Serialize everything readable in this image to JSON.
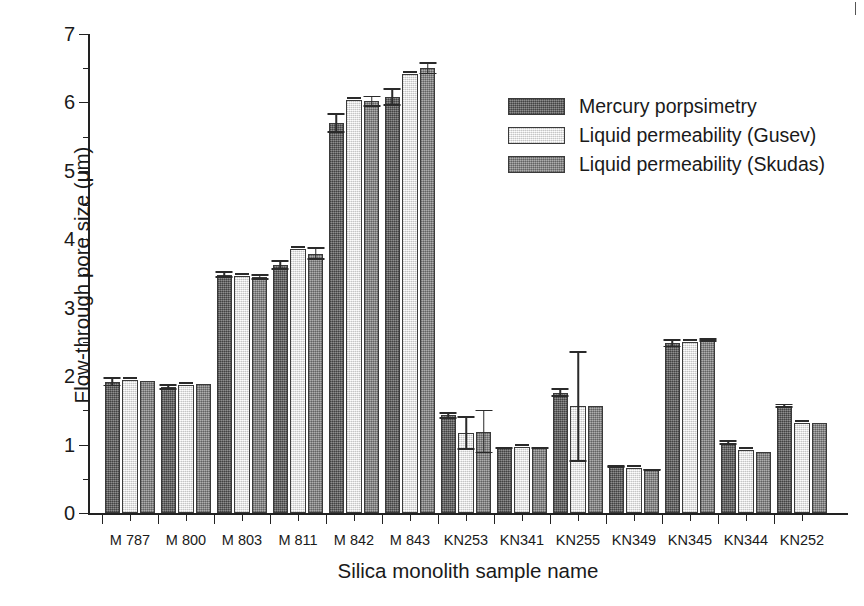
{
  "chart_data": {
    "type": "bar",
    "title": "",
    "xlabel": "Silica monolith sample name",
    "ylabel": "Flow-through pore size (μm)",
    "ylim": [
      0,
      7
    ],
    "ytick_step": 1,
    "yminor_step": 0.5,
    "grid": false,
    "legend_position": "top-right inside",
    "categories": [
      "M 787",
      "M 800",
      "M 803",
      "M 811",
      "M 842",
      "M 843",
      "KN253",
      "KN341",
      "KN255",
      "KN349",
      "KN345",
      "KN344",
      "KN252"
    ],
    "ytick_labels": [
      "0",
      "1",
      "2",
      "3",
      "4",
      "5",
      "6",
      "7"
    ],
    "series": [
      {
        "name": "Mercury porpsimetry",
        "color": "#6e6e6e",
        "values": [
          1.92,
          1.84,
          3.48,
          3.62,
          5.7,
          6.08,
          1.43,
          0.95,
          1.76,
          0.68,
          2.48,
          1.03,
          1.57
        ],
        "errors": [
          0.07,
          0.04,
          0.05,
          0.07,
          0.14,
          0.13,
          0.05,
          0.02,
          0.06,
          0.02,
          0.06,
          0.03,
          0.03
        ]
      },
      {
        "name": "Liquid permeability (Gusev)",
        "color": "#f4f4f4",
        "values": [
          1.94,
          1.87,
          3.47,
          3.86,
          6.03,
          6.42,
          1.17,
          0.96,
          1.56,
          0.66,
          2.5,
          0.92,
          1.32
        ],
        "errors": [
          0.0,
          0.0,
          0.0,
          0.0,
          0.0,
          0.0,
          0.25,
          0.0,
          0.81,
          0.0,
          0.0,
          0.0,
          0.0
        ]
      },
      {
        "name": "Liquid permeability (Skudas)",
        "color": "#919191",
        "values": [
          1.93,
          1.88,
          3.45,
          3.79,
          6.02,
          6.5,
          1.19,
          0.95,
          1.56,
          0.63,
          2.53,
          0.89,
          1.31
        ],
        "errors": [
          0.0,
          0.0,
          0.04,
          0.09,
          0.08,
          0.09,
          0.32,
          0.02,
          0.0,
          0.02,
          0.03,
          0.0,
          0.0
        ]
      }
    ]
  },
  "legend": {
    "items": [
      {
        "label": "Mercury porpsimetry"
      },
      {
        "label": "Liquid permeability (Gusev)"
      },
      {
        "label": "Liquid permeability (Skudas)"
      }
    ]
  }
}
